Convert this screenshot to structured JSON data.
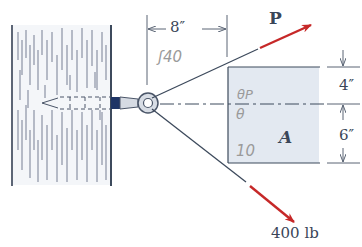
{
  "diagram": {
    "labels": {
      "force_p": "P",
      "force_400": "400 lb",
      "dim_horizontal": "8″",
      "dim_top": "4″",
      "dim_bottom": "6″",
      "region": "A"
    },
    "handwritten": {
      "angle_mark": "ʃ40",
      "theta_p": "θP",
      "theta": "θ",
      "ten": "10"
    },
    "colors": {
      "force_arrow": "#c62828",
      "line": "#3d4a5c",
      "region_fill": "#e3e9f1",
      "wall_hatch": "#7f8898",
      "text": "#3a4658",
      "handwriting": "#9a9a9a"
    }
  }
}
